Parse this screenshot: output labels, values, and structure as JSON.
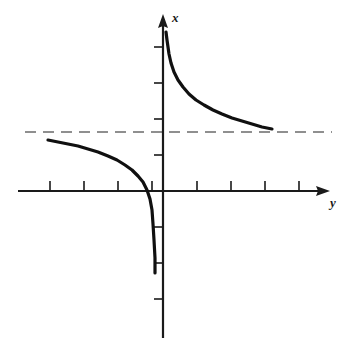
{
  "figure": {
    "kind": "cartesian-plot",
    "background_color": "#ffffff",
    "ink_color": "#1a1a1a",
    "asymptote_color": "#6b6b6b",
    "width": 346,
    "height": 355
  },
  "axes": {
    "vertical": {
      "name": "x-axis",
      "label": "x",
      "label_style": "italic",
      "arrow": "up",
      "pixel_x": 163,
      "pixel_top": 14,
      "pixel_bottom": 338,
      "tick_length": 9,
      "tick_side": "left",
      "ticks_px_y": [
        47,
        83,
        119,
        155,
        227,
        263,
        299
      ]
    },
    "horizontal": {
      "name": "y-axis",
      "label": "y",
      "label_style": "italic",
      "arrow": "right",
      "pixel_y": 191,
      "pixel_left": 18,
      "pixel_right": 330,
      "tick_length": 9,
      "tick_side": "up",
      "ticks_px_x": [
        50,
        84,
        118,
        152,
        197,
        231,
        265,
        299
      ]
    }
  },
  "asymptote": {
    "name": "horizontal-asymptote",
    "style": "dashed",
    "pixel_y": 132,
    "pixel_x_start": 25,
    "pixel_x_end": 332,
    "dash_pattern": "11 7",
    "stroke_width": 1.4
  },
  "chart_data": {
    "type": "line",
    "title": "",
    "xlabel": "y",
    "ylabel": "x",
    "grid": false,
    "legend": null,
    "axis_arrows": true,
    "origin_px": [
      163,
      191
    ],
    "px_per_tick_x": 34,
    "px_per_tick_y": 36,
    "asymptote_horizontal_px_y": 132,
    "asymptote_vertical_px_x": 163,
    "series": [
      {
        "name": "upper-right-branch",
        "points_px": [
          [
            166,
            32
          ],
          [
            167,
            40
          ],
          [
            169,
            54
          ],
          [
            171,
            63
          ],
          [
            174,
            72
          ],
          [
            178,
            80
          ],
          [
            183,
            87
          ],
          [
            189,
            94
          ],
          [
            196,
            100
          ],
          [
            204,
            105
          ],
          [
            213,
            110
          ],
          [
            222,
            114
          ],
          [
            232,
            118
          ],
          [
            242,
            121
          ],
          [
            252,
            124
          ],
          [
            262,
            127
          ],
          [
            272,
            129
          ]
        ]
      },
      {
        "name": "lower-left-branch",
        "points_px": [
          [
            48,
            140
          ],
          [
            58,
            142
          ],
          [
            68,
            144
          ],
          [
            78,
            146
          ],
          [
            88,
            149
          ],
          [
            98,
            152
          ],
          [
            108,
            156
          ],
          [
            117,
            160
          ],
          [
            125,
            165
          ],
          [
            132,
            170
          ],
          [
            138,
            176
          ],
          [
            143,
            182
          ],
          [
            147,
            190
          ],
          [
            150,
            199
          ],
          [
            152,
            210
          ],
          [
            153,
            224
          ],
          [
            154,
            240
          ],
          [
            155,
            258
          ],
          [
            155,
            273
          ]
        ]
      }
    ]
  }
}
